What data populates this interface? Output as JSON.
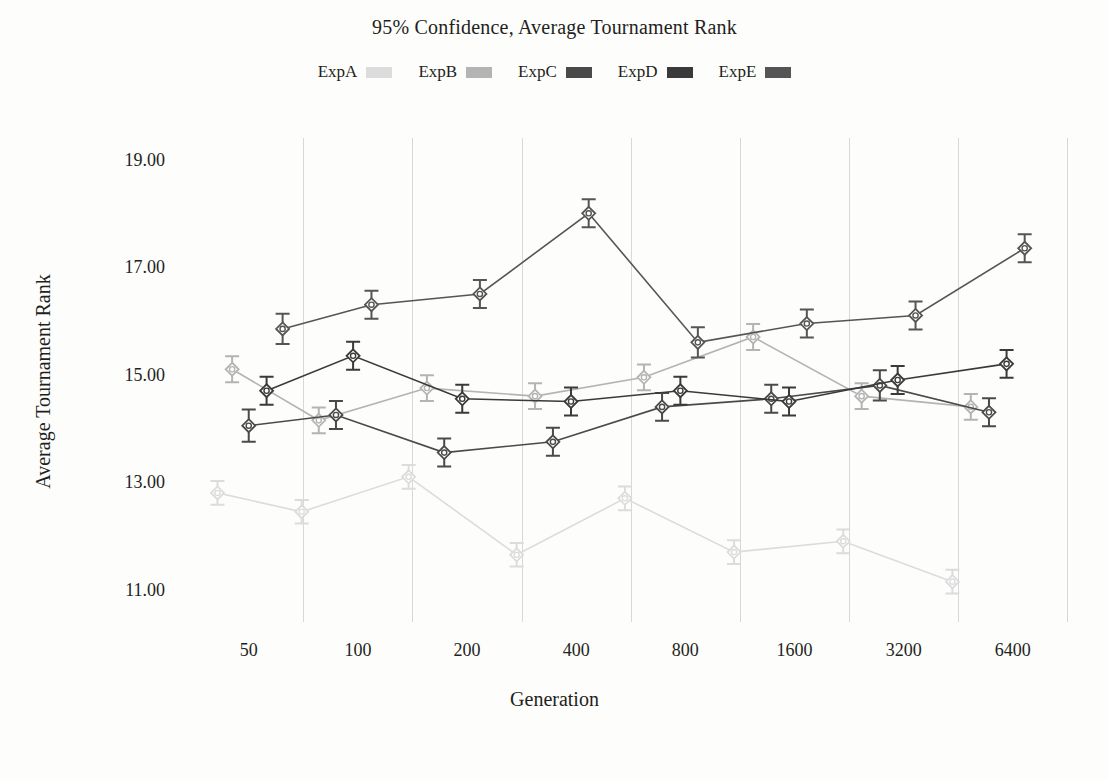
{
  "chart_data": {
    "type": "line",
    "title": "95% Confidence, Average Tournament Rank",
    "xlabel": "Generation",
    "ylabel": "Average Tournament Rank",
    "grid": true,
    "legend_position": "top-center",
    "xscale": "log2",
    "x_tick_labels": [
      "50",
      "100",
      "200",
      "400",
      "800",
      "1600",
      "3200",
      "6400"
    ],
    "x_tick_values": [
      50,
      100,
      200,
      400,
      800,
      1600,
      3200,
      6400
    ],
    "y_tick_labels": [
      "19.00",
      "17.00",
      "15.00",
      "13.00",
      "11.00"
    ],
    "y_tick_values": [
      19,
      17,
      15,
      13,
      11
    ],
    "ylim": [
      10.4,
      19.4
    ],
    "error_bar_kind": "95% confidence interval",
    "marker": "diamond",
    "series": [
      {
        "name": "ExpA",
        "color": "#dcdcdc",
        "x": [
          41,
          70,
          138,
          274,
          545,
          1090,
          2180,
          4360
        ],
        "values": [
          12.8,
          12.45,
          13.1,
          11.65,
          12.7,
          11.7,
          11.9,
          11.15
        ],
        "err": [
          0.22,
          0.22,
          0.22,
          0.22,
          0.22,
          0.22,
          0.22,
          0.22
        ]
      },
      {
        "name": "ExpB",
        "color": "#b4b4b4",
        "x": [
          45,
          78,
          155,
          308,
          615,
          1230,
          2450,
          4900
        ],
        "values": [
          15.1,
          14.15,
          14.75,
          14.6,
          14.95,
          15.7,
          14.6,
          14.4
        ],
        "err": [
          0.24,
          0.24,
          0.24,
          0.24,
          0.24,
          0.24,
          0.24,
          0.24
        ]
      },
      {
        "name": "ExpC",
        "color": "#4a4a4a",
        "x": [
          50,
          87,
          173,
          345,
          690,
          1380,
          2750,
          5500
        ],
        "values": [
          14.05,
          14.25,
          13.55,
          13.75,
          14.4,
          14.55,
          14.8,
          14.3
        ],
        "err": [
          0.3,
          0.26,
          0.26,
          0.26,
          0.26,
          0.26,
          0.28,
          0.26
        ]
      },
      {
        "name": "ExpD",
        "color": "#3a3a3a",
        "x": [
          56,
          97,
          194,
          387,
          775,
          1545,
          3080,
          6150
        ],
        "values": [
          14.7,
          15.35,
          14.55,
          14.5,
          14.7,
          14.5,
          14.9,
          15.2
        ],
        "err": [
          0.26,
          0.26,
          0.26,
          0.26,
          0.26,
          0.26,
          0.26,
          0.26
        ]
      },
      {
        "name": "ExpE",
        "color": "#555555",
        "x": [
          62,
          109,
          217,
          433,
          866,
          1730,
          3450,
          6900
        ],
        "values": [
          15.85,
          16.3,
          16.5,
          18.0,
          15.6,
          15.95,
          16.1,
          17.35
        ],
        "err": [
          0.28,
          0.26,
          0.26,
          0.26,
          0.28,
          0.26,
          0.26,
          0.26
        ]
      }
    ]
  },
  "legend": {
    "items": [
      {
        "label": "ExpA",
        "color": "#dcdcdc"
      },
      {
        "label": "ExpB",
        "color": "#b4b4b4"
      },
      {
        "label": "ExpC",
        "color": "#4a4a4a"
      },
      {
        "label": "ExpD",
        "color": "#3a3a3a"
      },
      {
        "label": "ExpE",
        "color": "#555555"
      }
    ]
  },
  "colors": {
    "background": "#fdfdfc",
    "text": "#231f20",
    "gridline": "#d8d8d8"
  }
}
